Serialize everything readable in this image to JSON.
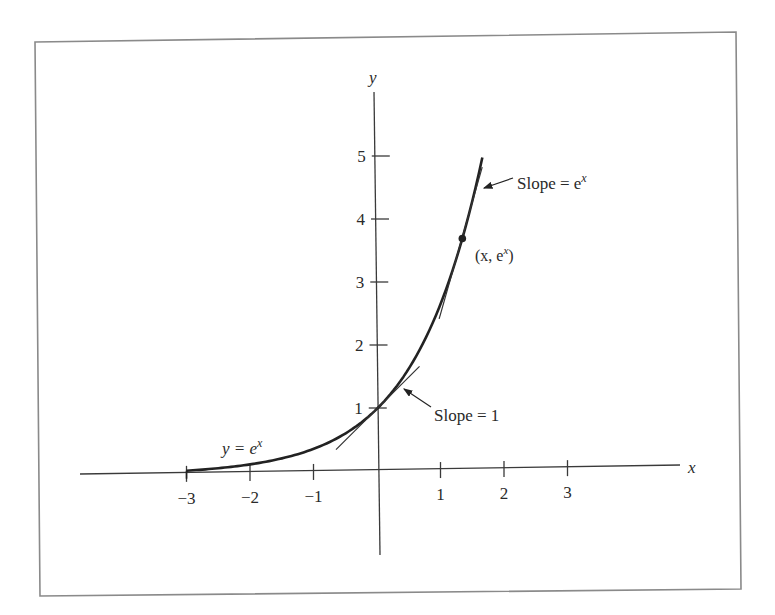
{
  "chart_data": {
    "type": "line",
    "title": "",
    "xlabel": "x",
    "ylabel": "y",
    "xlim": [
      -3,
      3
    ],
    "ylim": [
      0,
      5
    ],
    "grid": false,
    "x_ticks": [
      "−3",
      "−2",
      "−1",
      "1",
      "2",
      "3"
    ],
    "x_tick_values": [
      -3,
      -2,
      -1,
      1,
      2,
      3
    ],
    "y_ticks": [
      "1",
      "2",
      "3",
      "4",
      "5"
    ],
    "y_tick_values": [
      1,
      2,
      3,
      4,
      5
    ],
    "series": [
      {
        "name": "y = e^x",
        "function": "exp(x)",
        "x": [
          -3,
          -2.5,
          -2,
          -1.5,
          -1,
          -0.5,
          0,
          0.25,
          0.5,
          0.75,
          1,
          1.25,
          1.5,
          1.6
        ],
        "values": [
          0.05,
          0.08,
          0.14,
          0.22,
          0.37,
          0.61,
          1.0,
          1.28,
          1.65,
          2.12,
          2.72,
          3.49,
          4.48,
          4.95
        ]
      },
      {
        "name": "tangent at x=0",
        "x": [
          -0.65,
          0.65
        ],
        "values": [
          0.35,
          1.65
        ]
      },
      {
        "name": "tangent at x=1.3",
        "x": [
          0.95,
          1.6
        ],
        "values": [
          2.4,
          4.8
        ]
      }
    ],
    "points": [
      {
        "x": 1.3,
        "y": 3.67,
        "label": "(x, e^x)"
      }
    ],
    "annotations": [
      {
        "text": "y = e^x",
        "x": -2.4,
        "y": 0.4
      },
      {
        "text": "Slope = 1",
        "arrow_to": [
          0.4,
          1.3
        ]
      },
      {
        "text": "Slope = e^x",
        "arrow_to": [
          1.6,
          4.5
        ]
      },
      {
        "text": "(x, e^x)",
        "at": [
          1.3,
          3.67
        ]
      }
    ]
  },
  "labels": {
    "x_axis": "x",
    "y_axis": "y",
    "x_ticks": [
      "−3",
      "−2",
      "−1",
      "1",
      "2",
      "3"
    ],
    "y_ticks": [
      "1",
      "2",
      "3",
      "4",
      "5"
    ],
    "curve_label_lhs": "y = e",
    "curve_label_exp": "x",
    "point_label_open": "(x, e",
    "point_label_exp": "x",
    "point_label_close": ")",
    "slope1": "Slope = 1",
    "slope_ex_base": "Slope = e",
    "slope_ex_exp": "x"
  }
}
